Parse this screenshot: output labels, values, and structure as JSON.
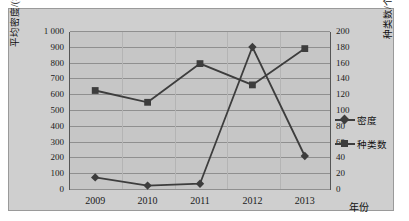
{
  "chart_data": {
    "type": "line",
    "title": "",
    "categories": [
      "2009",
      "2010",
      "2011",
      "2012",
      "2013"
    ],
    "xlabel": "年份",
    "ylabel": "平均密度/(×10⁴ 个/m³)",
    "y2label": "种类数/个",
    "ylim": [
      0,
      1000
    ],
    "y2lim": [
      0,
      200
    ],
    "ytick_step": 100,
    "y2tick_step": 20,
    "grid": true,
    "legend_position": "right",
    "series": [
      {
        "name": "密度",
        "axis": "left",
        "marker": "diamond",
        "color": "#3d3d3d",
        "values": [
          80,
          28,
          40,
          905,
          215
        ]
      },
      {
        "name": "种类数",
        "axis": "right",
        "marker": "square",
        "color": "#3d3d3d",
        "values": [
          126,
          111,
          160,
          133,
          179
        ]
      }
    ],
    "yticks": [
      "1 000",
      "900",
      "800",
      "700",
      "600",
      "500",
      "400",
      "300",
      "200",
      "100",
      "0"
    ],
    "y2ticks": [
      "200",
      "180",
      "160",
      "140",
      "120",
      "100",
      "80",
      "60",
      "40",
      "20",
      "0"
    ]
  },
  "legend": {
    "items": [
      {
        "label": "密度",
        "marker": "diamond"
      },
      {
        "label": "种类数",
        "marker": "square"
      }
    ]
  },
  "axis": {
    "left_title_prefix": "平均密度/(×10",
    "left_title_exp": "4",
    "left_title_suffix": " 个/m",
    "left_title_exp2": "3",
    "left_title_close": ")",
    "right_title": "种类数/个",
    "x_title": "年份"
  }
}
